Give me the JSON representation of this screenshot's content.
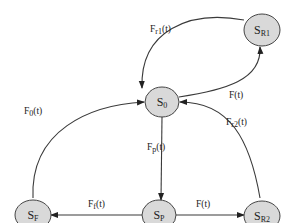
{
  "nodes": [
    {
      "id": "S0",
      "main": "S",
      "sub": "0",
      "cx": 162,
      "cy": 102
    },
    {
      "id": "SR1",
      "main": "S",
      "sub": "R1",
      "cx": 262,
      "cy": 30
    },
    {
      "id": "SF",
      "main": "S",
      "sub": "F",
      "cx": 33,
      "cy": 215
    },
    {
      "id": "SP",
      "main": "S",
      "sub": "P",
      "cx": 159,
      "cy": 215
    },
    {
      "id": "SR2",
      "main": "S",
      "sub": "R2",
      "cx": 262,
      "cy": 216
    }
  ],
  "edges": [
    {
      "id": "SR1-S0",
      "label_main": "F",
      "label_sub": "r1",
      "label_tail": "(t)"
    },
    {
      "id": "S0-SR1",
      "label_main": "F(t)",
      "label_sub": "",
      "label_tail": ""
    },
    {
      "id": "SF-S0",
      "label_main": "F",
      "label_sub": "0",
      "label_tail": "(t)"
    },
    {
      "id": "SR2-S0",
      "label_main": "F",
      "label_sub": "r2",
      "label_tail": "(t)"
    },
    {
      "id": "S0-SP",
      "label_main": "F",
      "label_sub": "p",
      "label_tail": "(t)"
    },
    {
      "id": "SP-SF",
      "label_main": "F",
      "label_sub": "f",
      "label_tail": "(t)"
    },
    {
      "id": "SP-SR2",
      "label_main": "F(t)",
      "label_sub": "",
      "label_tail": ""
    }
  ]
}
